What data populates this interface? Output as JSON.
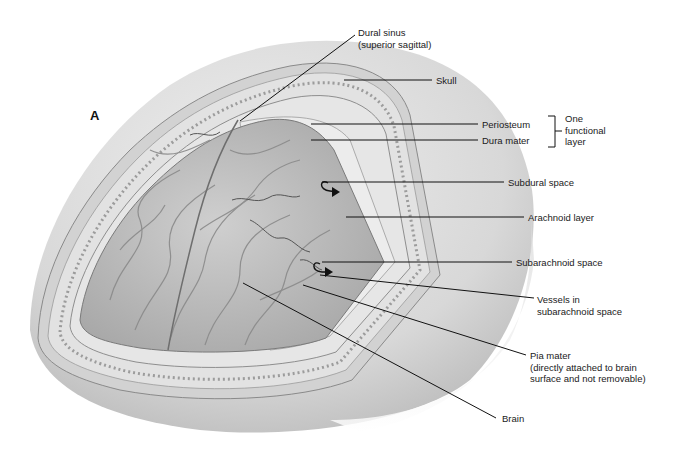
{
  "figure": {
    "panel_letter": "A",
    "colors": {
      "background": "#ffffff",
      "skull": "#d6d6d6",
      "skull_light": "#ebebeb",
      "bone_rim": "#c2c2c2",
      "dura": "#e4e4e4",
      "brain": "#bdbdbd",
      "brain_dark": "#8e8e8e",
      "leader_line": "#111111"
    },
    "labels": {
      "dural_sinus_1": "Dural sinus",
      "dural_sinus_2": "(superior sagittal)",
      "skull": "Skull",
      "periosteum": "Periosteum",
      "dura_mater": "Dura mater",
      "functional_1": "One",
      "functional_2": "functional",
      "functional_3": "layer",
      "subdural": "Subdural space",
      "arachnoid": "Arachnoid layer",
      "subarachnoid": "Subarachnoid space",
      "vessels_1": "Vessels in",
      "vessels_2": "subarachnoid space",
      "pia_1": "Pia mater",
      "pia_2": "(directly attached to brain",
      "pia_3": "surface and not removable)",
      "brain": "Brain"
    }
  }
}
